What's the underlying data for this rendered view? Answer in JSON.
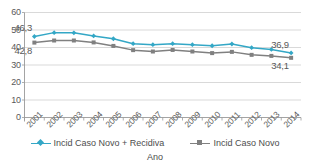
{
  "chart_data": {
    "type": "line",
    "title": "",
    "xlabel": "Ano",
    "ylabel": "",
    "ylim": [
      0,
      60
    ],
    "yticks": [
      0,
      10,
      20,
      30,
      40,
      50,
      60
    ],
    "grid": true,
    "legend_position": "bottom",
    "categories": [
      "2001",
      "2002",
      "2003",
      "2004",
      "2005",
      "2006",
      "2007",
      "2008",
      "2009",
      "2010",
      "2011",
      "2012",
      "2013",
      "2014"
    ],
    "series": [
      {
        "name": "Incid Caso Novo + Recidiva",
        "color": "#33A7C6",
        "marker": "diamond",
        "values": [
          46.3,
          48.5,
          48.4,
          46.6,
          45.0,
          42.2,
          41.6,
          42.2,
          41.6,
          41.0,
          42.0,
          39.9,
          38.9,
          36.9
        ]
      },
      {
        "name": "Incid Caso Novo",
        "color": "#808080",
        "marker": "square",
        "values": [
          42.8,
          44.0,
          44.0,
          42.9,
          40.9,
          38.5,
          37.7,
          38.6,
          37.7,
          36.8,
          37.5,
          35.8,
          35.2,
          34.1
        ]
      }
    ],
    "annotations": [
      {
        "text": "46,3",
        "series": "Incid Caso Novo + Recidiva",
        "category": "2001",
        "value": 46.3,
        "placement": "above-left"
      },
      {
        "text": "42,8",
        "series": "Incid Caso Novo",
        "category": "2001",
        "value": 42.8,
        "placement": "below-left"
      },
      {
        "text": "36,9",
        "series": "Incid Caso Novo + Recidiva",
        "category": "2014",
        "value": 36.9,
        "placement": "above-left"
      },
      {
        "text": "34,1",
        "series": "Incid Caso Novo",
        "category": "2014",
        "value": 34.1,
        "placement": "below-left"
      }
    ]
  },
  "axes": {
    "y_tick_labels": [
      "60",
      "50",
      "40",
      "30",
      "20",
      "10",
      "0"
    ],
    "x_tick_labels": [
      "2001",
      "2002",
      "2003",
      "2004",
      "2005",
      "2006",
      "2007",
      "2008",
      "2009",
      "2010",
      "2011",
      "2012",
      "2013",
      "2014"
    ],
    "x_axis_title": "Ano"
  },
  "legend": {
    "items": [
      {
        "label": "Incid Caso Novo + Recidiva",
        "color": "#33A7C6",
        "marker": "diamond"
      },
      {
        "label": "Incid Caso Novo",
        "color": "#808080",
        "marker": "square"
      }
    ]
  },
  "labels": {
    "first_blue": "46,3",
    "first_gray": "42,8",
    "last_blue": "36,9",
    "last_gray": "34,1"
  },
  "colors": {
    "series_blue": "#33A7C6",
    "series_gray": "#808080",
    "grid": "#c8c8c8",
    "axis": "#9a9a9a",
    "text": "#595959"
  }
}
